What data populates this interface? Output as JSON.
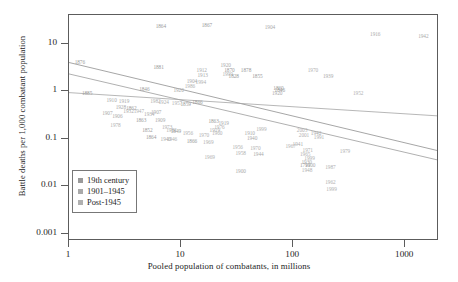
{
  "chart_data": {
    "type": "scatter",
    "title": "",
    "xlabel": "Pooled population of combatants, in millions",
    "ylabel": "Battle deaths per 1,000 combatant population",
    "xscale": "log",
    "yscale": "log",
    "xlim": [
      1,
      2000
    ],
    "ylim": [
      0.0007,
      40
    ],
    "xticks": [
      "1",
      "10",
      "100",
      "1000"
    ],
    "xtick_values": [
      1,
      10,
      100,
      1000
    ],
    "yticks": [
      "10",
      "1",
      "0.1",
      "0.01",
      "0.001"
    ],
    "ytick_values": [
      10,
      1,
      0.1,
      0.01,
      0.001
    ],
    "grid": false,
    "legend_position": "lower-left",
    "colors": {
      "19th_century": "#9a9a9a",
      "1901_1945": "#a9a9a9",
      "post_1945": "#b0b0b0",
      "frame": "#5c5c5c",
      "text": "#1d1d1d"
    },
    "legend": [
      {
        "label": "19th century",
        "color": "#9a9a9a",
        "series": "19th_century"
      },
      {
        "label": "1901–1945",
        "color": "#a9a9a9",
        "series": "1901_1945"
      },
      {
        "label": "Post-1945",
        "color": "#b0b0b0",
        "series": "post_1945"
      }
    ],
    "trend_lines": [
      {
        "series": "19th_century",
        "x1": 1,
        "y1": 4.0,
        "x2": 2000,
        "y2": 0.055,
        "color": "#8f8f8f"
      },
      {
        "series": "1901_1945",
        "x1": 1,
        "y1": 2.3,
        "x2": 2000,
        "y2": 0.035,
        "color": "#9c9c9c"
      },
      {
        "series": "post_1945",
        "x1": 1,
        "y1": 0.93,
        "x2": 2000,
        "y2": 0.3,
        "color": "#a5a5a5"
      }
    ],
    "points": [
      {
        "label": "1864",
        "x": 6.6,
        "y": 22.0,
        "series": "19th_century"
      },
      {
        "label": "1867",
        "x": 17.0,
        "y": 23.0,
        "series": "19th_century"
      },
      {
        "label": "1904",
        "x": 62.0,
        "y": 21.0,
        "series": "1901_1945"
      },
      {
        "label": "1916",
        "x": 540.0,
        "y": 15.5,
        "series": "1901_1945"
      },
      {
        "label": "1942",
        "x": 1450.0,
        "y": 13.5,
        "series": "1901_1945"
      },
      {
        "label": "1876",
        "x": 1.25,
        "y": 4.0,
        "series": "19th_century"
      },
      {
        "label": "1881",
        "x": 6.3,
        "y": 3.1,
        "series": "19th_century"
      },
      {
        "label": "1920",
        "x": 25.0,
        "y": 3.3,
        "series": "1901_1945"
      },
      {
        "label": "1912",
        "x": 15.3,
        "y": 2.6,
        "series": "1901_1945"
      },
      {
        "label": "1913",
        "x": 15.6,
        "y": 2.1,
        "series": "1901_1945"
      },
      {
        "label": "1870",
        "x": 27.0,
        "y": 2.7,
        "series": "19th_century"
      },
      {
        "label": "1999",
        "x": 26.0,
        "y": 2.2,
        "series": "post_1945"
      },
      {
        "label": "1828",
        "x": 29.5,
        "y": 1.95,
        "series": "19th_century"
      },
      {
        "label": "1878",
        "x": 38.0,
        "y": 2.6,
        "series": "19th_century"
      },
      {
        "label": "1855",
        "x": 48.0,
        "y": 2.0,
        "series": "19th_century"
      },
      {
        "label": "1970",
        "x": 150.0,
        "y": 2.7,
        "series": "post_1945"
      },
      {
        "label": "1939",
        "x": 205.0,
        "y": 2.0,
        "series": "1901_1945"
      },
      {
        "label": "1904",
        "x": 12.5,
        "y": 1.55,
        "series": "1901_1945"
      },
      {
        "label": "1986",
        "x": 12.0,
        "y": 1.25,
        "series": "post_1945"
      },
      {
        "label": "1994",
        "x": 15.0,
        "y": 1.5,
        "series": "post_1945"
      },
      {
        "label": "1846",
        "x": 4.7,
        "y": 1.05,
        "series": "19th_century"
      },
      {
        "label": "1920",
        "x": 9.5,
        "y": 1.0,
        "series": "1901_1945"
      },
      {
        "label": "1885",
        "x": 1.45,
        "y": 0.85,
        "series": "19th_century"
      },
      {
        "label": "1860",
        "x": 74.0,
        "y": 1.1,
        "series": "19th_century"
      },
      {
        "label": "1846",
        "x": 76.0,
        "y": 1.0,
        "series": "19th_century"
      },
      {
        "label": "1920",
        "x": 72.0,
        "y": 0.85,
        "series": "1901_1945"
      },
      {
        "label": "1952",
        "x": 380.0,
        "y": 0.85,
        "series": "post_1945"
      },
      {
        "label": "1910",
        "x": 2.4,
        "y": 0.62,
        "series": "1901_1945"
      },
      {
        "label": "1919",
        "x": 3.1,
        "y": 0.58,
        "series": "1901_1945"
      },
      {
        "label": "1982",
        "x": 5.9,
        "y": 0.6,
        "series": "post_1945"
      },
      {
        "label": "1924",
        "x": 7.0,
        "y": 0.56,
        "series": "post_1945"
      },
      {
        "label": "1957",
        "x": 9.2,
        "y": 0.53,
        "series": "post_1945"
      },
      {
        "label": "1859",
        "x": 11.0,
        "y": 0.5,
        "series": "19th_century"
      },
      {
        "label": "1866",
        "x": 14.0,
        "y": 0.56,
        "series": "19th_century"
      },
      {
        "label": "1907",
        "x": 2.2,
        "y": 0.33,
        "series": "1901_1945"
      },
      {
        "label": "1906",
        "x": 2.7,
        "y": 0.29,
        "series": "1901_1945"
      },
      {
        "label": "1934",
        "x": 5.2,
        "y": 0.32,
        "series": "1901_1945"
      },
      {
        "label": "1863",
        "x": 4.4,
        "y": 0.23,
        "series": "19th_century"
      },
      {
        "label": "1909",
        "x": 6.5,
        "y": 0.24,
        "series": "1901_1945"
      },
      {
        "label": "1928",
        "x": 2.9,
        "y": 0.44,
        "series": "1901_1945"
      },
      {
        "label": "1862",
        "x": 3.6,
        "y": 0.42,
        "series": "19th_century"
      },
      {
        "label": "1932",
        "x": 3.4,
        "y": 0.37,
        "series": "1901_1945"
      },
      {
        "label": "1947",
        "x": 4.2,
        "y": 0.36,
        "series": "post_1945"
      },
      {
        "label": "1907",
        "x": 6.0,
        "y": 0.35,
        "series": "1901_1945"
      },
      {
        "label": "1978",
        "x": 2.6,
        "y": 0.185,
        "series": "post_1945"
      },
      {
        "label": "1852",
        "x": 5.0,
        "y": 0.145,
        "series": "19th_century"
      },
      {
        "label": "1982",
        "x": 8.2,
        "y": 0.145,
        "series": "post_1945"
      },
      {
        "label": "1864",
        "x": 5.4,
        "y": 0.105,
        "series": "19th_century"
      },
      {
        "label": "1973",
        "x": 7.5,
        "y": 0.17,
        "series": "post_1945"
      },
      {
        "label": "1849",
        "x": 9.0,
        "y": 0.135,
        "series": "19th_century"
      },
      {
        "label": "1956",
        "x": 11.5,
        "y": 0.125,
        "series": "post_1945"
      },
      {
        "label": "1940",
        "x": 7.3,
        "y": 0.095,
        "series": "1901_1945"
      },
      {
        "label": "1946",
        "x": 8.3,
        "y": 0.092,
        "series": "post_1945"
      },
      {
        "label": "1969",
        "x": 17.5,
        "y": 0.082,
        "series": "post_1945"
      },
      {
        "label": "1863",
        "x": 19.5,
        "y": 0.22,
        "series": "19th_century"
      },
      {
        "label": "1866",
        "x": 12.5,
        "y": 0.085,
        "series": "19th_century"
      },
      {
        "label": "1960",
        "x": 21.0,
        "y": 0.125,
        "series": "post_1945"
      },
      {
        "label": "1970",
        "x": 16.0,
        "y": 0.115,
        "series": "post_1945"
      },
      {
        "label": "1919",
        "x": 20.0,
        "y": 0.145,
        "series": "1901_1945"
      },
      {
        "label": "1976",
        "x": 22.0,
        "y": 0.17,
        "series": "post_1945"
      },
      {
        "label": "1919",
        "x": 24.0,
        "y": 0.2,
        "series": "1901_1945"
      },
      {
        "label": "1999",
        "x": 52.0,
        "y": 0.155,
        "series": "post_1945"
      },
      {
        "label": "1910",
        "x": 41.0,
        "y": 0.125,
        "series": "1901_1945"
      },
      {
        "label": "1940",
        "x": 43.0,
        "y": 0.1,
        "series": "1901_1945"
      },
      {
        "label": "1956",
        "x": 32.0,
        "y": 0.062,
        "series": "post_1945"
      },
      {
        "label": "1970",
        "x": 46.0,
        "y": 0.06,
        "series": "post_1945"
      },
      {
        "label": "1958",
        "x": 34.0,
        "y": 0.048,
        "series": "post_1945"
      },
      {
        "label": "1944",
        "x": 49.0,
        "y": 0.046,
        "series": "1901_1945"
      },
      {
        "label": "2003",
        "x": 120.0,
        "y": 0.145,
        "series": "post_1945"
      },
      {
        "label": "2001",
        "x": 125.0,
        "y": 0.115,
        "series": "post_1945"
      },
      {
        "label": "1942",
        "x": 160.0,
        "y": 0.125,
        "series": "1901_1945"
      },
      {
        "label": "1991",
        "x": 170.0,
        "y": 0.105,
        "series": "post_1945"
      },
      {
        "label": "1941",
        "x": 110.0,
        "y": 0.075,
        "series": "1901_1945"
      },
      {
        "label": "1967",
        "x": 95.0,
        "y": 0.068,
        "series": "post_1945"
      },
      {
        "label": "1971",
        "x": 135.0,
        "y": 0.055,
        "series": "post_1945"
      },
      {
        "label": "1979",
        "x": 290.0,
        "y": 0.052,
        "series": "post_1945"
      },
      {
        "label": "1965",
        "x": 128.0,
        "y": 0.045,
        "series": "post_1945"
      },
      {
        "label": "1999",
        "x": 140.0,
        "y": 0.038,
        "series": "post_1945"
      },
      {
        "label": "1930",
        "x": 132.0,
        "y": 0.03,
        "series": "1901_1945"
      },
      {
        "label": "1900",
        "x": 142.0,
        "y": 0.026,
        "series": "1901_1945"
      },
      {
        "label": "1791",
        "x": 128.0,
        "y": 0.026,
        "series": "19th_century"
      },
      {
        "label": "1948",
        "x": 133.0,
        "y": 0.021,
        "series": "post_1945"
      },
      {
        "label": "1987",
        "x": 215.0,
        "y": 0.024,
        "series": "post_1945"
      },
      {
        "label": "1962",
        "x": 215.0,
        "y": 0.0115,
        "series": "post_1945"
      },
      {
        "label": "1999",
        "x": 220.0,
        "y": 0.0082,
        "series": "post_1945"
      },
      {
        "label": "1900",
        "x": 34.0,
        "y": 0.02,
        "series": "1901_1945"
      },
      {
        "label": "1969",
        "x": 18.0,
        "y": 0.04,
        "series": "post_1945"
      }
    ]
  }
}
